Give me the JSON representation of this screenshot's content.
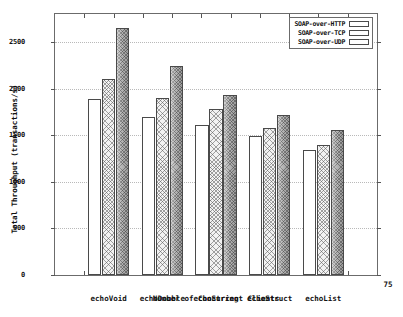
{
  "chart_data": {
    "type": "bar",
    "title": "",
    "xlabel": "Number of Concurrent Clients",
    "ylabel": "Total Throughput (transactions/s)",
    "categories": [
      "echoVoid",
      "echoDouble",
      "echoString",
      "echoStruct",
      "echoList"
    ],
    "series": [
      {
        "name": "SOAP-over-HTTP",
        "values": [
          1890,
          1690,
          1610,
          1490,
          1340
        ]
      },
      {
        "name": "SOAP-over-TCP",
        "values": [
          2100,
          1900,
          1785,
          1580,
          1395
        ]
      },
      {
        "name": "SOAP-over-UDP",
        "values": [
          2650,
          2240,
          1930,
          1720,
          1555
        ]
      }
    ],
    "ylim": [
      0,
      2800
    ],
    "yticks": [
      0,
      500,
      1000,
      1500,
      2000,
      2500
    ],
    "ytick_labels": [
      "0",
      "500",
      "1000",
      "1500",
      "2000",
      "2500"
    ],
    "grid": true,
    "legend_position": "top-right",
    "corner_note": "75"
  },
  "legend": {
    "entries": [
      {
        "label": "SOAP-over-HTTP",
        "style": "open-white"
      },
      {
        "label": "SOAP-over-TCP",
        "style": "light-crosshatch"
      },
      {
        "label": "SOAP-over-UDP",
        "style": "dark-crosshatch"
      }
    ]
  },
  "caption": {
    "partial_text": ""
  }
}
